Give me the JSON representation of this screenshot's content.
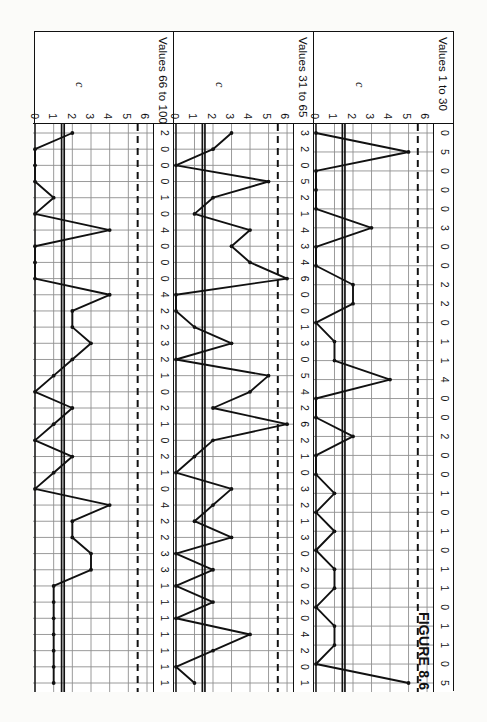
{
  "figure": {
    "caption": "FIGURE 8.6",
    "orientation_deg": 90,
    "y_axis_label": "c",
    "y_ticks": [
      6,
      5,
      4,
      3,
      2,
      1,
      0
    ],
    "colors": {
      "ink": "#111111",
      "grid": "#8f8f8f",
      "paper": "#ffffff",
      "scan_background": "#f7f7f5"
    }
  },
  "chart_data": [
    {
      "type": "line",
      "title": "Values 1 to 30",
      "xlabel": "",
      "ylabel": "c",
      "ylim": [
        0,
        6
      ],
      "grid": true,
      "legend": "none",
      "center_line": 1.5,
      "upper_control_limit": 5.5,
      "lower_control_limit": 0,
      "x": [
        1,
        2,
        3,
        4,
        5,
        6,
        7,
        8,
        9,
        10,
        11,
        12,
        13,
        14,
        15,
        16,
        17,
        18,
        19,
        20,
        21,
        22,
        23,
        24,
        25,
        26,
        27,
        28,
        29,
        30
      ],
      "categories": [
        "0",
        "5",
        "0",
        "0",
        "0",
        "3",
        "0",
        "0",
        "2",
        "2",
        "0",
        "1",
        "1",
        "4",
        "0",
        "0",
        "2",
        "0",
        "0",
        "1",
        "0",
        "1",
        "0",
        "1",
        "1",
        "0",
        "1",
        "1",
        "0",
        "5"
      ],
      "values": [
        0,
        5,
        0,
        0,
        0,
        3,
        0,
        0,
        2,
        2,
        0,
        1,
        1,
        4,
        0,
        0,
        2,
        0,
        0,
        1,
        0,
        1,
        0,
        1,
        1,
        0,
        1,
        1,
        0,
        5
      ],
      "last_point": 3,
      "annotations": [
        "dashed line = UCL",
        "solid line = center line"
      ]
    },
    {
      "type": "line",
      "title": "Values 31 to 65",
      "xlabel": "",
      "ylabel": "c",
      "ylim": [
        0,
        6
      ],
      "grid": true,
      "legend": "none",
      "center_line": 1.5,
      "upper_control_limit": 5.5,
      "lower_control_limit": 0,
      "x": [
        31,
        32,
        33,
        34,
        35,
        36,
        37,
        38,
        39,
        40,
        41,
        42,
        43,
        44,
        45,
        46,
        47,
        48,
        49,
        50,
        51,
        52,
        53,
        54,
        55,
        56,
        57,
        58,
        59,
        60,
        61,
        62,
        63,
        64,
        65
      ],
      "categories": [
        "3",
        "2",
        "0",
        "5",
        "2",
        "1",
        "4",
        "3",
        "4",
        "6",
        "0",
        "0",
        "1",
        "3",
        "0",
        "5",
        "4",
        "2",
        "6",
        "2",
        "1",
        "0",
        "3",
        "2",
        "1",
        "3",
        "0",
        "2",
        "0",
        "2",
        "0",
        "4",
        "2",
        "0",
        "1"
      ],
      "values": [
        3,
        2,
        0,
        5,
        2,
        1,
        4,
        3,
        4,
        6,
        0,
        0,
        1,
        3,
        0,
        5,
        4,
        2,
        6,
        2,
        1,
        0,
        3,
        2,
        1,
        3,
        0,
        2,
        0,
        2,
        0,
        4,
        2,
        0,
        1
      ],
      "annotations": [
        "dashed line = UCL",
        "solid line = center line"
      ]
    },
    {
      "type": "line",
      "title": "Values 66 to 100",
      "xlabel": "",
      "ylabel": "c",
      "ylim": [
        0,
        6
      ],
      "grid": true,
      "legend": "none",
      "center_line": 1.5,
      "upper_control_limit": 5.5,
      "lower_control_limit": 0,
      "x": [
        66,
        67,
        68,
        69,
        70,
        71,
        72,
        73,
        74,
        75,
        76,
        77,
        78,
        79,
        80,
        81,
        82,
        83,
        84,
        85,
        86,
        87,
        88,
        89,
        90,
        91,
        92,
        93,
        94,
        95,
        96,
        97,
        98,
        99,
        100
      ],
      "categories": [
        "2",
        "0",
        "0",
        "0",
        "1",
        "0",
        "4",
        "0",
        "0",
        "0",
        "4",
        "2",
        "2",
        "3",
        "2",
        "1",
        "0",
        "2",
        "1",
        "0",
        "2",
        "1",
        "0",
        "4",
        "2",
        "2",
        "3",
        "3",
        "1",
        "1",
        "1",
        "1",
        "1",
        "1",
        "1"
      ],
      "values": [
        2,
        0,
        0,
        0,
        1,
        0,
        4,
        0,
        0,
        0,
        4,
        2,
        2,
        3,
        2,
        1,
        0,
        2,
        1,
        0,
        2,
        1,
        0,
        4,
        2,
        2,
        3,
        3,
        1,
        1,
        1,
        1,
        1,
        1,
        1
      ],
      "annotations": [
        "dashed line = UCL",
        "solid line = center line"
      ]
    }
  ]
}
